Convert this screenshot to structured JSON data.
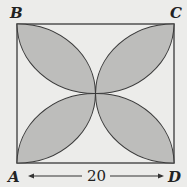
{
  "figure": {
    "type": "square with four shaded petals (lens shapes) meeting at center",
    "vertices": {
      "top_left": "B",
      "top_right": "C",
      "bottom_left": "A",
      "bottom_right": "D"
    },
    "dimension_label": "20",
    "dimension_between": [
      "A",
      "D"
    ],
    "colors": {
      "background": "#ececea",
      "petal_fill": "#bdbdbb",
      "stroke": "#3a3a3a"
    }
  }
}
